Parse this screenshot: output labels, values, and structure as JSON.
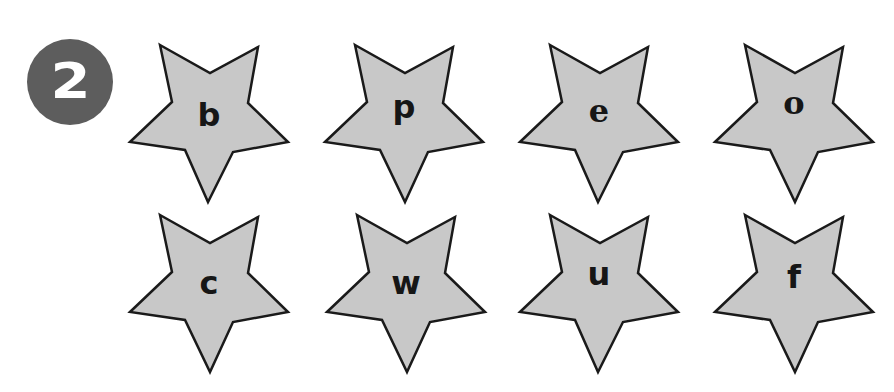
{
  "exercise": {
    "number": "2",
    "badge_color": "#5d5d5d",
    "star_fill": "#c8c8c8",
    "star_stroke": "#1a1a1a"
  },
  "stars": [
    {
      "letter": "b",
      "row": 1,
      "col": 1
    },
    {
      "letter": "p",
      "row": 1,
      "col": 2
    },
    {
      "letter": "e",
      "row": 1,
      "col": 3
    },
    {
      "letter": "o",
      "row": 1,
      "col": 4
    },
    {
      "letter": "c",
      "row": 2,
      "col": 1
    },
    {
      "letter": "w",
      "row": 2,
      "col": 2
    },
    {
      "letter": "u",
      "row": 2,
      "col": 3
    },
    {
      "letter": "f",
      "row": 2,
      "col": 4
    }
  ]
}
